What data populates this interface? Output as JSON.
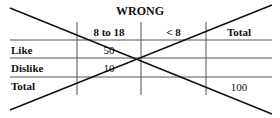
{
  "title": "WRONG",
  "columns": [
    "",
    "8 to 18",
    "< 8",
    "Total"
  ],
  "rows": [
    {
      "label": "Like",
      "cells": [
        "50",
        "",
        ""
      ]
    },
    {
      "label": "Dislike",
      "cells": [
        "10",
        "",
        ""
      ]
    },
    {
      "label": "Total",
      "cells": [
        "",
        "",
        "100"
      ]
    }
  ],
  "annotation": "Table crossed out with a large X"
}
